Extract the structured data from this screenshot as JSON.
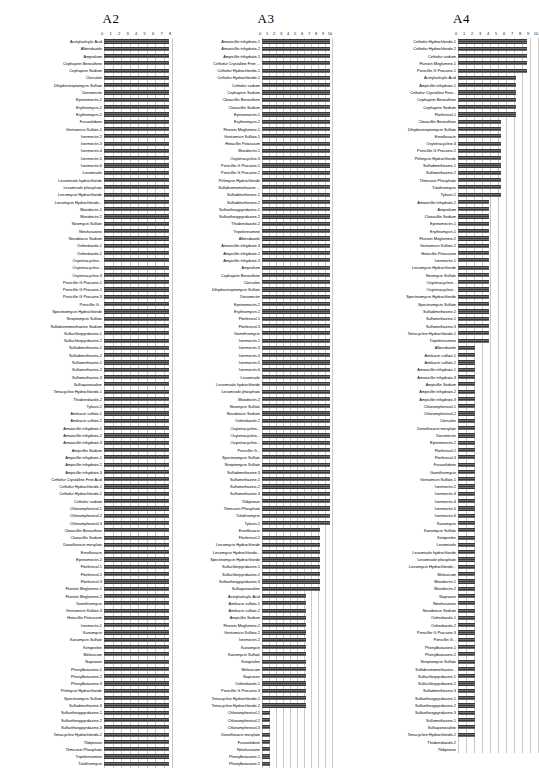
{
  "figure": {
    "background": "#ffffff",
    "bar_color": "#4a4a4a",
    "grid_color": "#c9c9c9"
  },
  "chart_data": [
    {
      "type": "bar",
      "orientation": "horizontal",
      "title": "A2",
      "xlabel": "",
      "ylabel": "",
      "xlim": [
        0,
        8
      ],
      "ticks": [
        "0",
        "1",
        "2",
        "3",
        "4",
        "5",
        "6",
        "7",
        "8"
      ],
      "grid": true,
      "legend": "none",
      "categories": [
        "Acetylsalicylic Acid",
        "Albendazole",
        "Amprolium",
        "Cephapirin Benzathine",
        "Cephapirin Sodium",
        "Clorsulon",
        "Dihydrostreptomycin Sulfate",
        "Doramectin",
        "Eprinomectin-1",
        "Erythromycin-1",
        "Erythromycin-2",
        "Furazolidone",
        "Gentamicin Sulfate-1",
        "Ivermectin-2",
        "Ivermectin-3",
        "Ivermectin-4",
        "Ivermectin-5",
        "Ivermectin-6",
        "Levamisole",
        "Levamisole hydrochloride",
        "Levamisole phosphate",
        "Lincomycin Hydrochloride",
        "Lincomycin Hydrochloride...",
        "Moxidectin-1",
        "Moxidectin-2",
        "Neomycin Sulfate",
        "Nitrofurazone",
        "Novobiocin Sodium",
        "Oxfendazole-1",
        "Oxfendazole-2",
        "Oxytetracycline...",
        "Oxytetracycline...",
        "Oxytetracycline-3",
        "Penicillin G Procaine-1",
        "Penicillin G Procaine-2",
        "Penicillin G Procaine-3",
        "Penicillin G...",
        "Spectinomycin Hydrochloride",
        "Streptomycin Sulfate",
        "Sulfabromomethazine Sodium",
        "Sulfachlorpyridazine-1",
        "Sulfachlorpyridazine-2",
        "Sulfadimethoxine-1",
        "Sulfadimethoxine-2",
        "Sulfamethazine-1",
        "Sulfamethazine-2",
        "Sulfamethazine-3",
        "Sulfaquinoxaline",
        "Tetracycline Hydrochloride-1",
        "Thiabendazole-2",
        "Tylosin-2",
        "Amikacin sulfate-1",
        "Amikacin sulfate-2",
        "Amoxicillin trihydrate-1",
        "Amoxicillin trihydrate-2",
        "Amoxicillin trihydrate-3",
        "Ampicillin Sodium",
        "Ampicillin trihydrate-1",
        "Ampicillin trihydrate-2",
        "Ampicillin trihydrate-3",
        "Ceftiofur Crystalline Free Acid",
        "Ceftiofur Hydrochloride-1",
        "Ceftiofur Hydrochloride-2",
        "Ceftiofur sodium",
        "Chloramphenicol-1",
        "Chloramphenicol-2",
        "Chloramphenicol-3",
        "Cloxacillin Benzathine",
        "Cloxacillin Sodium",
        "Danofloxacin mesylate",
        "Enrofloxacin",
        "Eprinomectin-2",
        "Florfenicol-1",
        "Florfenicol-2",
        "Florfenicol-3",
        "Flunixin Meglumine-1",
        "Flunixin Meglumine-2",
        "Gamithromycin",
        "Gentamicin Sulfate-3",
        "Hetacillin Potassium",
        "Ivermectin-1",
        "Kanamycin",
        "Kanamycin Sulfate",
        "Ketoprofen",
        "Meloxicam",
        "Naproxen",
        "Phenylbutazone-1",
        "Phenylbutazone-2",
        "Phenylbutazone-3",
        "Pirlimycin Hydrochloride",
        "Spectinomycin Sulfate",
        "Sulfadimethoxine-3",
        "Sulfaethoxypyridazine-1",
        "Sulfaethoxypyridazine-2",
        "Sulfaethoxypyridazine-3",
        "Tetracycline Hydrochloride-2",
        "Tildipirosin",
        "Tilmicosin Phosphate",
        "Tripelennamine",
        "Tulathromycin"
      ],
      "values": [
        7.7,
        7.7,
        7.7,
        7.7,
        7.7,
        7.7,
        7.7,
        7.7,
        7.7,
        7.7,
        7.7,
        7.7,
        7.7,
        7.7,
        7.7,
        7.7,
        7.7,
        7.7,
        7.7,
        7.7,
        7.7,
        7.7,
        7.7,
        7.7,
        7.7,
        7.7,
        7.7,
        7.7,
        7.7,
        7.7,
        7.7,
        7.7,
        7.7,
        7.7,
        7.7,
        7.7,
        7.7,
        7.7,
        7.7,
        7.7,
        7.7,
        7.7,
        7.7,
        7.7,
        7.7,
        7.7,
        7.7,
        7.7,
        7.7,
        7.7,
        7.7,
        7.7,
        7.7,
        7.7,
        7.7,
        7.7,
        7.7,
        7.7,
        7.7,
        7.7,
        7.7,
        7.7,
        7.7,
        7.7,
        7.7,
        7.7,
        7.7,
        7.7,
        7.7,
        7.7,
        7.7,
        7.7,
        7.7,
        7.7,
        7.7,
        7.7,
        7.7,
        7.7,
        7.7,
        7.7,
        7.7,
        7.7,
        7.7,
        7.7,
        7.7,
        7.7,
        7.7,
        7.7,
        7.7,
        7.7,
        7.7,
        7.7,
        7.7,
        7.7,
        7.7,
        7.7,
        7.7,
        7.7,
        7.7,
        7.7
      ]
    },
    {
      "type": "bar",
      "orientation": "horizontal",
      "title": "A3",
      "xlabel": "",
      "ylabel": "",
      "xlim": [
        0,
        10
      ],
      "ticks": [
        "0",
        "1",
        "2",
        "3",
        "4",
        "5",
        "6",
        "7",
        "8",
        "9",
        "10"
      ],
      "grid": true,
      "legend": "none",
      "categories": [
        "Amoxicillin trihydrate-1",
        "Amoxicillin trihydrate-2",
        "Ampicillin trihydrate-1",
        "Ceftiofur Crystalline Free ...",
        "Ceftiofur Hydrochloride-1",
        "Ceftiofur Hydrochloride-2",
        "Ceftiofur sodium",
        "Cephapirin Sodium",
        "Cloxacillin Benzathine",
        "Cloxacillin Sodium",
        "Eprinomectin-1",
        "Erythromycin-2",
        "Flunixin Meglumine-1",
        "Gentamicin Sulfate-1",
        "Hetacillin Potassium",
        "Moxidectin-1",
        "Oxytetracycline-3",
        "Penicillin G Procaine-1",
        "Penicillin G Procaine-2",
        "Pirlimycin Hydrochloride",
        "Sulfabromomethazine ...",
        "Sulfadimethoxine-1",
        "Sulfadimethoxine-2",
        "Sulfaethoxypyridazine-1",
        "Sulfaethoxypyridazine-2",
        "Thiabendazole-2",
        "Tripelennamine",
        "Albendazole",
        "Amoxicillin trihydrate-3",
        "Ampicillin trihydrate-2",
        "Ampicillin trihydrate-3",
        "Amprolium",
        "Cephapirin Benzathine",
        "Clorsulon",
        "Dihydrostreptomycin Sulfate",
        "Doramectin",
        "Eprinomectin-2",
        "Erythromycin-1",
        "Florfenicol-1",
        "Florfenicol-3",
        "Gamithromycin",
        "Ivermectin-1",
        "Ivermectin-3",
        "Ivermectin-4",
        "Ivermectin-5",
        "Ivermectin-6",
        "Levamisole",
        "Levamisole hydrochloride",
        "Levamisole phosphate",
        "Moxidectin-2",
        "Neomycin Sulfate",
        "Novobiocin Sodium",
        "Oxfendazole-2",
        "Oxytetracycline...",
        "Oxytetracycline...",
        "Oxytetracycline...",
        "Penicillin G...",
        "Spectinomycin Sulfate",
        "Streptomycin Sulfate",
        "Sulfadimethoxine-3",
        "Sulfamethazine-1",
        "Sulfamethazine-2",
        "Sulfamethazine-3",
        "Tildipirosin",
        "Tilmicosin Phosphate",
        "Tulathromycin",
        "Tylosin-2",
        "Enrofloxacin",
        "Florfenicol-2",
        "Lincomycin Hydrochloride",
        "Lincomycin Hydrochloride...",
        "Spectinomycin Hydrochloride",
        "Sulfachlorpyridazine-1",
        "Sulfachlorpyridazine-2",
        "Sulfaethoxypyridazine-3",
        "Sulfaquinoxaline",
        "Acetylsalicylic Acid",
        "Amikacin sulfate-1",
        "Amikacin sulfate-2",
        "Ampicillin Sodium",
        "Flunixin Meglumine-2",
        "Gentamicin Sulfate-2",
        "Ivermectin-2",
        "Kanamycin",
        "Kanamycin Sulfate",
        "Ketoprofen",
        "Meloxicam",
        "Naproxen",
        "Oxfendazole-1",
        "Penicillin G Procaine-3",
        "Tetracycline Hydrochloride-1",
        "Tetracycline Hydrochloride-2",
        "Chloramphenicol-1",
        "Chloramphenicol-2",
        "Chloramphenicol-3",
        "Danofloxacin mesylate",
        "Furazolidone",
        "Nitrofurazone",
        "Phenylbutazone-1",
        "Phenylbutazone-2"
      ],
      "values": [
        9.7,
        9.7,
        9.7,
        9.7,
        9.7,
        9.7,
        9.7,
        9.7,
        9.7,
        9.7,
        9.7,
        9.7,
        9.7,
        9.7,
        9.7,
        9.7,
        9.7,
        9.7,
        9.7,
        9.7,
        9.7,
        9.7,
        9.7,
        9.7,
        9.7,
        9.7,
        9.7,
        9.7,
        9.7,
        9.7,
        9.7,
        9.7,
        9.7,
        9.7,
        9.7,
        9.7,
        9.7,
        9.7,
        9.7,
        9.7,
        9.7,
        9.7,
        9.7,
        9.7,
        9.7,
        9.7,
        9.7,
        9.7,
        9.7,
        9.7,
        9.7,
        9.7,
        9.7,
        9.7,
        9.7,
        9.7,
        9.7,
        9.7,
        9.7,
        9.7,
        9.7,
        9.7,
        9.7,
        9.7,
        9.7,
        9.7,
        9.7,
        8.3,
        8.3,
        8.3,
        8.3,
        8.3,
        8.3,
        8.3,
        8.3,
        8.3,
        6.3,
        6.3,
        6.3,
        6.3,
        6.3,
        6.3,
        6.3,
        6.3,
        6.3,
        6.3,
        6.3,
        6.3,
        6.3,
        6.3,
        6.3,
        6.3,
        1.2,
        1.2,
        1.2,
        1.2,
        1.2,
        1.2,
        1.2,
        1.2
      ]
    },
    {
      "type": "bar",
      "orientation": "horizontal",
      "title": "A4",
      "xlabel": "",
      "ylabel": "",
      "xlim": [
        0,
        10
      ],
      "ticks": [
        "0",
        "1",
        "2",
        "3",
        "4",
        "5",
        "6",
        "7",
        "8",
        "9",
        "10"
      ],
      "grid": true,
      "legend": "none",
      "categories": [
        "Ceftiofur Hydrochloride-1",
        "Ceftiofur Hydrochloride-2",
        "Ceftiofur sodium",
        "Flunixin Meglumine-1",
        "Penicillin G Procaine-1",
        "Acetylsalicylic Acid",
        "Ampicillin trihydrate-1",
        "Ceftiofur Crystalline Free...",
        "Cephapirin Benzathine",
        "Cephapirin Sodium",
        "Florfenicol-1",
        "Cloxacillin Benzathine",
        "Dihydrostreptomycin Sulfate",
        "Enrofloxacin",
        "Oxytetracycline-3",
        "Penicillin G Procaine-2",
        "Pirlimycin Hydrochloride",
        "Sulfadimethoxine-1",
        "Sulfamethazine-2",
        "Tilmicosin Phosphate",
        "Tulathromycin",
        "Tylosin-2",
        "Amoxicillin trihydrate-2",
        "Amprolium",
        "Cloxacillin Sodium",
        "Eprinomectin-1",
        "Erythromycin-1",
        "Flunixin Meglumine-2",
        "Gentamicin Sulfate-2",
        "Hetacillin Potassium",
        "Ivermectin-1",
        "Lincomycin Hydrochloride",
        "Neomycin Sulfate",
        "Oxytetracycline...",
        "Oxytetracycline...",
        "Spectinomycin Hydrochloride",
        "Spectinomycin Sulfate",
        "Sulfadimethoxine-2",
        "Sulfamethazine-1",
        "Sulfamethazine-3",
        "Tetracycline Hydrochloride-1",
        "Tripelennamine",
        "Albendazole",
        "Amikacin sulfate-1",
        "Amikacin sulfate-2",
        "Amoxicillin trihydrate-1",
        "Amoxicillin trihydrate-3",
        "Ampicillin Sodium",
        "Ampicillin trihydrate-2",
        "Ampicillin trihydrate-3",
        "Chloramphenicol-1",
        "Chloramphenicol-2",
        "Clorsulon",
        "Danofloxacin mesylate",
        "Doramectin",
        "Eprinomectin-2",
        "Florfenicol-2",
        "Florfenicol-3",
        "Furazolidone",
        "Gamithromycin",
        "Gentamicin Sulfate-1",
        "Ivermectin-2",
        "Ivermectin-3",
        "Ivermectin-4",
        "Ivermectin-5",
        "Ivermectin-6",
        "Kanamycin",
        "Kanamycin Sulfate",
        "Ketoprofen",
        "Levamisole",
        "Levamisole hydrochloride",
        "Levamisole phosphate",
        "Lincomycin Hydrochloride...",
        "Meloxicam",
        "Moxidectin-1",
        "Moxidectin-2",
        "Naproxen",
        "Nitrofurazone",
        "Novobiocin Sodium",
        "Oxfendazole-1",
        "Oxfendazole-2",
        "Penicillin G Procaine-3",
        "Penicillin G...",
        "Phenylbutazone-1",
        "Phenylbutazone-2",
        "Streptomycin Sulfate",
        "Sulfabromomethazine...",
        "Sulfachlorpyridazine-1",
        "Sulfachlorpyridazine-2",
        "Sulfadimethoxine-3",
        "Sulfaethoxypyridazine-1",
        "Sulfaethoxypyridazine-2",
        "Sulfaethoxypyridazine-3",
        "Sulfamethazine-1",
        "Sulfaquinoxaline",
        "Tetracycline Hydrochloride-2",
        "Thiabendazole-2",
        "Tildipirosin"
      ],
      "values": [
        8.6,
        8.6,
        8.6,
        8.6,
        8.6,
        7.2,
        7.2,
        7.2,
        7.2,
        7.2,
        7.2,
        5.4,
        5.4,
        5.4,
        5.4,
        5.4,
        5.4,
        5.4,
        5.4,
        5.4,
        5.4,
        5.4,
        3.9,
        3.9,
        3.9,
        3.9,
        3.9,
        3.9,
        3.9,
        3.9,
        3.9,
        3.9,
        3.9,
        3.9,
        3.9,
        3.9,
        3.9,
        3.9,
        3.9,
        3.9,
        3.9,
        3.9,
        2.1,
        2.1,
        2.1,
        2.1,
        2.1,
        2.1,
        2.1,
        2.1,
        2.1,
        2.1,
        2.1,
        2.1,
        2.1,
        2.1,
        2.1,
        2.1,
        2.1,
        2.1,
        2.1,
        2.1,
        2.1,
        2.1,
        2.1,
        2.1,
        2.1,
        2.1,
        2.1,
        2.1,
        2.1,
        2.1,
        2.1,
        2.1,
        2.1,
        2.1,
        2.1,
        2.1,
        2.1,
        2.1,
        2.1,
        2.1,
        2.1,
        2.1,
        2.1,
        2.1,
        2.1,
        2.1,
        2.1,
        2.1,
        2.1,
        2.1,
        2.1,
        2.1,
        2.1,
        2.1
      ]
    }
  ]
}
